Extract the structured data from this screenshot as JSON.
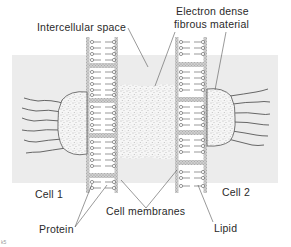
{
  "diagram": {
    "type": "cell junction cross-section",
    "labels": {
      "intercellular_space": "Intercellular space",
      "electron_dense_line1": "Electron dense",
      "electron_dense_line2": "fibrous material",
      "cell1": "Cell 1",
      "cell2": "Cell 2",
      "cell_membranes": "Cell membranes",
      "protein": "Protein",
      "lipid": "Lipid",
      "corner_mark": "k5"
    },
    "colors": {
      "cell_band": "#ececec",
      "membrane_edge": "#9a9a9a",
      "membrane_fill": "#e2e2e2",
      "stipple": "#8a8a8a",
      "ink": "#3a3a3a"
    }
  }
}
